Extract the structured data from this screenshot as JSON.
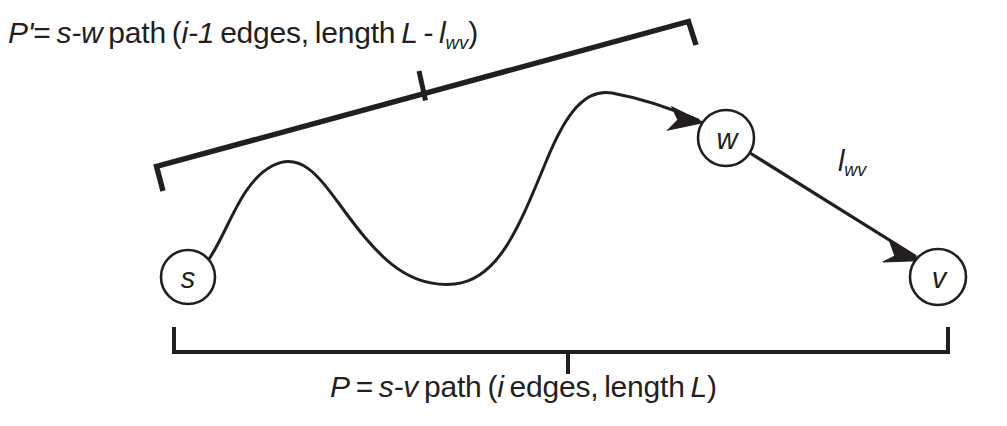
{
  "diagram": {
    "background_color": "#ffffff",
    "stroke_color": "#231f20",
    "labels": {
      "top_path": {
        "full_text": "P' = s-w path (i-1 edges, length L - lwv)",
        "name": "P'",
        "prime": "'",
        "equals": "=",
        "endpoints": "s-w",
        "path_word": "path",
        "open_paren": "(",
        "edge_count": "i-1",
        "edges_word": "edges,",
        "length_word": "length",
        "length_value": "L",
        "minus": "-",
        "weight_symbol": "l",
        "weight_subscript": "wv",
        "close_paren": ")"
      },
      "bottom_path": {
        "full_text": "P = s-v path (i edges, length L)",
        "name": "P",
        "equals": "=",
        "endpoints": "s-v",
        "path_word": "path",
        "open_paren": "(",
        "edge_count": "i",
        "edges_word": "edges,",
        "length_word": "length",
        "length_value": "L",
        "close_paren": ")"
      },
      "edge_weight": {
        "symbol": "l",
        "subscript": "wv",
        "full_text": "lwv"
      }
    },
    "nodes": [
      {
        "id": "s",
        "label": "s",
        "cx": 188,
        "cy": 277,
        "r": 27
      },
      {
        "id": "w",
        "label": "w",
        "cx": 726,
        "cy": 138,
        "r": 28
      },
      {
        "id": "v",
        "label": "v",
        "cx": 938,
        "cy": 277,
        "r": 28
      }
    ],
    "edges": [
      {
        "id": "s-to-w",
        "from": "s",
        "to": "w",
        "style": "wavy-curve",
        "arrow": true
      },
      {
        "id": "w-to-v",
        "from": "w",
        "to": "v",
        "style": "straight",
        "arrow": true,
        "weight_label": "lwv"
      }
    ],
    "brackets": [
      {
        "id": "top-bracket",
        "spans": "s-to-w",
        "orientation": "slanted",
        "tick_direction": "up"
      },
      {
        "id": "bottom-bracket",
        "spans": "s-to-v",
        "orientation": "horizontal",
        "tick_direction": "down"
      }
    ]
  }
}
